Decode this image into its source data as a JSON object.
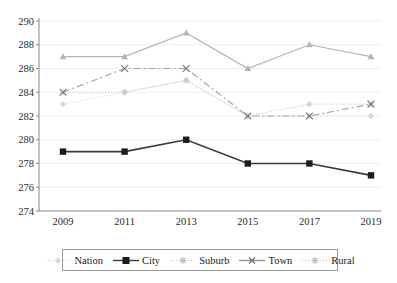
{
  "chart_data": {
    "type": "line",
    "title": "",
    "xlabel": "",
    "ylabel": "",
    "categories": [
      "2009",
      "2011",
      "2013",
      "2015",
      "2017",
      "2019"
    ],
    "x": [
      2009,
      2011,
      2013,
      2015,
      2017,
      2019
    ],
    "ylim": [
      274,
      290
    ],
    "yticks": [
      274,
      276,
      278,
      280,
      282,
      284,
      286,
      288,
      290
    ],
    "ytick_labels": [
      "274",
      "276",
      "278",
      "280",
      "282",
      "284",
      "286",
      "288",
      "290"
    ],
    "grid": true,
    "grid_axis": "y",
    "legend_position": "bottom",
    "series": [
      {
        "name": "Nation",
        "values": [
          283,
          284,
          285,
          282,
          282,
          282
        ],
        "color": "#d6d6d6",
        "marker": "diamond",
        "dash": "1,2"
      },
      {
        "name": "City",
        "values": [
          279,
          279,
          280,
          278,
          278,
          277
        ],
        "color": "#3a3a3a",
        "marker": "square",
        "dash": "none"
      },
      {
        "name": "Suburb",
        "values": [
          284,
          284,
          285,
          282,
          283,
          283
        ],
        "color": "#c9c9c9",
        "marker": "star",
        "dash": "1,2"
      },
      {
        "name": "Town",
        "values": [
          284,
          286,
          286,
          282,
          282,
          283
        ],
        "color": "#a5a5a5",
        "marker": "x",
        "dash": "7,3,2,3"
      },
      {
        "name": "Rural",
        "values": [
          287,
          287,
          289,
          286,
          288,
          287
        ],
        "color": "#b4b4b4",
        "marker": "triangle",
        "dash": "none"
      }
    ]
  },
  "axis": {
    "y_labels": [
      "290",
      "288",
      "286",
      "284",
      "282",
      "280",
      "278",
      "276",
      "274"
    ],
    "x_labels": [
      "2009",
      "2011",
      "2013",
      "2015",
      "2017",
      "2019"
    ]
  },
  "legend": {
    "items": [
      {
        "label": "Nation"
      },
      {
        "label": "City"
      },
      {
        "label": "Suburb"
      },
      {
        "label": "Town"
      },
      {
        "label": "Rural"
      }
    ]
  }
}
